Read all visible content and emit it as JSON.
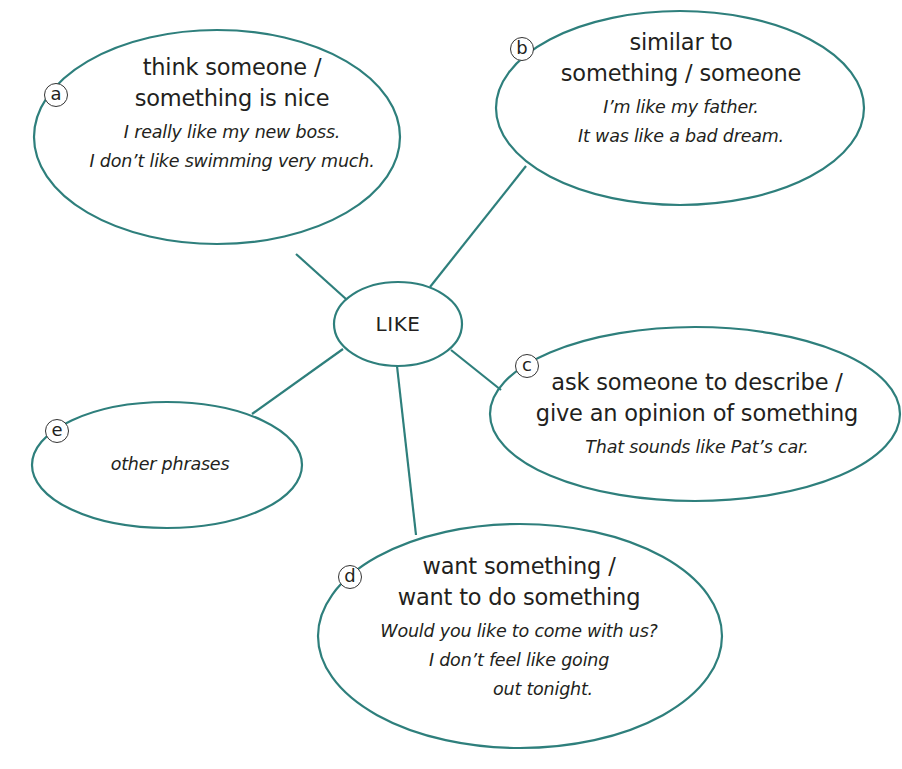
{
  "diagram": {
    "type": "mind-map",
    "colors": {
      "stroke": "#2e7f7c",
      "text": "#231f20",
      "background": "#ffffff"
    },
    "center": {
      "label": "LIKE"
    },
    "nodes": [
      {
        "id": "a",
        "letter": "a",
        "heading": [
          "think someone /",
          "something is nice"
        ],
        "examples": [
          "I really like my new boss.",
          "I don’t like swimming very much."
        ]
      },
      {
        "id": "b",
        "letter": "b",
        "heading": [
          "similar to",
          "something / someone"
        ],
        "examples": [
          "I’m like my father.",
          "It was like a bad dream."
        ]
      },
      {
        "id": "c",
        "letter": "c",
        "heading": [
          "ask someone to describe /",
          "give an opinion of something"
        ],
        "examples": [
          "That sounds like Pat’s car."
        ]
      },
      {
        "id": "d",
        "letter": "d",
        "heading": [
          "want something /",
          "want to do something"
        ],
        "examples": [
          "Would you like to come with us?",
          "I don’t feel like going",
          "out tonight."
        ]
      },
      {
        "id": "e",
        "letter": "e",
        "heading": [],
        "examples": [
          "other phrases"
        ]
      }
    ]
  }
}
